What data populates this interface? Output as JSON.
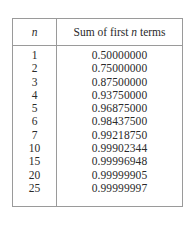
{
  "table": {
    "headers": {
      "n": "n",
      "sum_prefix": "Sum of first ",
      "sum_var": "n",
      "sum_suffix": " terms"
    },
    "rows": [
      {
        "n": "1",
        "sum": "0.50000000"
      },
      {
        "n": "2",
        "sum": "0.75000000"
      },
      {
        "n": "3",
        "sum": "0.87500000"
      },
      {
        "n": "4",
        "sum": "0.93750000"
      },
      {
        "n": "5",
        "sum": "0.96875000"
      },
      {
        "n": "6",
        "sum": "0.98437500"
      },
      {
        "n": "7",
        "sum": "0.99218750"
      },
      {
        "n": "10",
        "sum": "0.99902344"
      },
      {
        "n": "15",
        "sum": "0.99996948"
      },
      {
        "n": "20",
        "sum": "0.99999905"
      },
      {
        "n": "25",
        "sum": "0.99999997"
      }
    ]
  }
}
